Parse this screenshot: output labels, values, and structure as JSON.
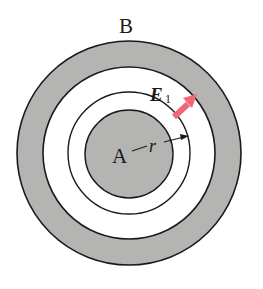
{
  "diagram": {
    "outer_shell_label": "B",
    "inner_sphere_label": "A",
    "radius_label": "r",
    "field_label_main": "E",
    "field_label_sub": "1",
    "colors": {
      "shell_fill": "#b4b4b2",
      "line": "#1a1a1a",
      "field_arrow": "#f0677a",
      "background": "#ffffff"
    }
  }
}
